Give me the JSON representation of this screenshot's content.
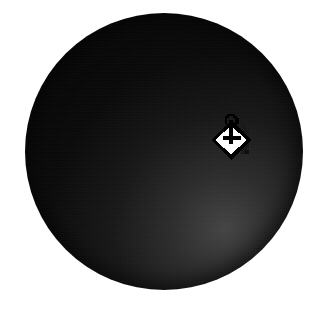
{
  "canvas": {
    "width": 331,
    "height": 309,
    "background_color": "#ffffff",
    "alt_text": "Large dark sphere on a white background with a paint bucket fill cursor over it"
  },
  "sphere": {
    "name": "dark-sphere",
    "shape": "circle",
    "center_x": 164,
    "center_y": 151,
    "radius": 139,
    "bounds": {
      "left": 25,
      "top": 13,
      "width": 278,
      "height": 277
    },
    "base_color": "#080808",
    "rim_highlight_color": "#3a3a3a",
    "shadow_color": "#000000",
    "highlight_position": "lower-right",
    "label": ""
  },
  "cursor": {
    "name": "paint-bucket-cursor",
    "icon": "paint-bucket-icon",
    "tool": "Fill",
    "x": 207,
    "y": 114,
    "width": 48,
    "height": 50,
    "hotspot_x": 228,
    "hotspot_y": 138,
    "fill_color": "#ffffff",
    "outline_color": "#000000",
    "pour_color": "#1a1a1a",
    "label": ""
  },
  "colors": {
    "background": "#ffffff",
    "sphere_dark": "#080808",
    "sphere_light_rim": "#3a3a3a",
    "cursor_white": "#ffffff",
    "cursor_black": "#000000"
  }
}
